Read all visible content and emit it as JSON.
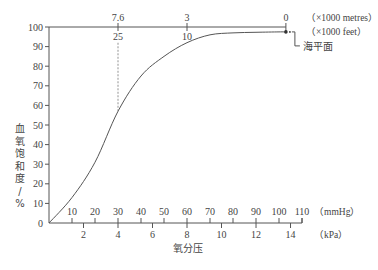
{
  "chart_data": {
    "type": "line",
    "title": "",
    "caption": "",
    "xlabel": "氧分压",
    "ylabel": "血氧饱和度/%",
    "ylim": [
      0,
      100
    ],
    "y_ticks": [
      0,
      10,
      20,
      30,
      40,
      50,
      60,
      70,
      80,
      90,
      100
    ],
    "x_axis_mmHg": {
      "unit": "（mmHg）",
      "ticks": [
        10,
        20,
        30,
        40,
        50,
        60,
        70,
        80,
        90,
        100,
        110
      ],
      "range": [
        0,
        110
      ]
    },
    "x_axis_kPa": {
      "unit": "（kPa）",
      "ticks": [
        2,
        4,
        6,
        8,
        10,
        12,
        14
      ]
    },
    "top_axis_altitude": {
      "metres_unit": "（×1000 metres）",
      "feet_unit": "（×1000 feet）",
      "ticks": [
        {
          "mmHg": 30,
          "metres": "7.6",
          "feet": "25"
        },
        {
          "mmHg": 60,
          "metres": "3",
          "feet": "10"
        },
        {
          "mmHg": 103,
          "metres": "0",
          "feet": ""
        }
      ]
    },
    "series": [
      {
        "name": "氧解离曲线",
        "x_mmHg": [
          0,
          10,
          20,
          30,
          40,
          50,
          60,
          70,
          80,
          90,
          100,
          103
        ],
        "y_percent": [
          0,
          13,
          31,
          57,
          75,
          85,
          92,
          96,
          97,
          97.3,
          97.5,
          97.5
        ]
      }
    ],
    "annotations": [
      {
        "text": "海平面",
        "x_mmHg": 103,
        "y_percent": 97.5,
        "note": "sea level marker (dot)"
      },
      {
        "type": "dashed-vertical",
        "x_mmHg": 30,
        "from_percent": 57,
        "to_percent": 100
      }
    ],
    "grid": false,
    "legend": "none"
  }
}
